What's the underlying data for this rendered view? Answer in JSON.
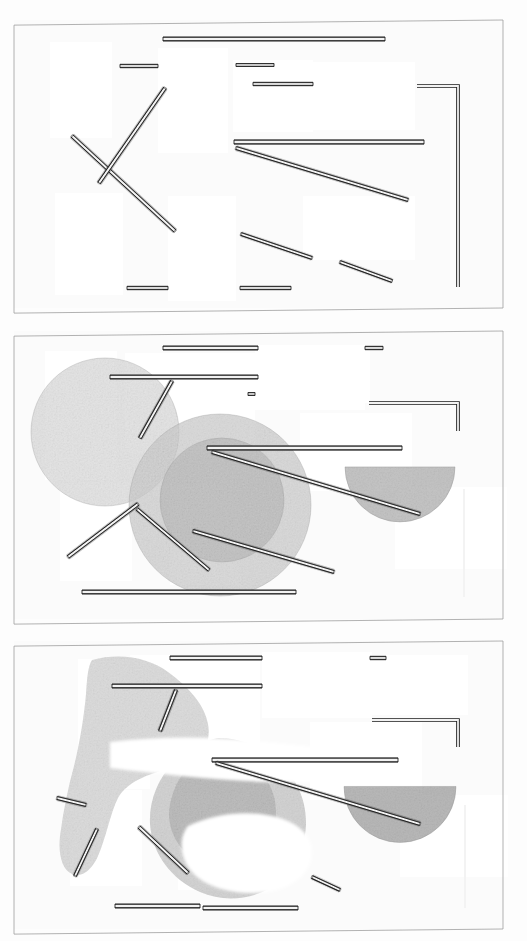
{
  "document": {
    "title": "Scanned figure sheet — three-panel rod arrangement",
    "kind": "photocopied line-drawing diagram",
    "sheet_background": "#fdfdfd",
    "paper_tint": "#fbfbfb",
    "border_color": "#9a9a9a",
    "rod_outline_color": "#1c1c1c",
    "rod_fill_color": "#f2f2f2",
    "blob_tone_light": "#d9d9d9",
    "blob_tone_mid": "#c2c2c2",
    "blob_tone_dark": "#a8a8a8",
    "patch_color": "#ffffff",
    "width": 527,
    "height": 941
  },
  "panels": [
    {
      "id": "panel-1",
      "label": "Panel 1 — rods only",
      "frame": {
        "x": 14,
        "y": 20,
        "w": 489,
        "h": 288,
        "skew_deg": -0.6
      },
      "patches": [
        {
          "x": 50,
          "y": 42,
          "w": 62,
          "h": 96
        },
        {
          "x": 158,
          "y": 48,
          "w": 70,
          "h": 105
        },
        {
          "x": 233,
          "y": 60,
          "w": 80,
          "h": 72
        },
        {
          "x": 305,
          "y": 62,
          "w": 110,
          "h": 68
        },
        {
          "x": 55,
          "y": 193,
          "w": 68,
          "h": 102
        },
        {
          "x": 168,
          "y": 196,
          "w": 68,
          "h": 105
        },
        {
          "x": 303,
          "y": 196,
          "w": 112,
          "h": 64
        }
      ],
      "rods": [
        {
          "name": "rod-top-long",
          "x1": 163,
          "y1": 39,
          "x2": 385,
          "y2": 39,
          "w": 4.0
        },
        {
          "name": "rod-upper-left",
          "x1": 120,
          "y1": 66,
          "x2": 158,
          "y2": 66,
          "w": 3.4
        },
        {
          "name": "rod-upper-mid",
          "x1": 236,
          "y1": 65,
          "x2": 274,
          "y2": 65,
          "w": 3.2
        },
        {
          "name": "rod-upper-right",
          "x1": 253,
          "y1": 84,
          "x2": 313,
          "y2": 84,
          "w": 3.4
        },
        {
          "name": "rod-mid-long",
          "x1": 234,
          "y1": 142,
          "x2": 424,
          "y2": 142,
          "w": 4.2
        },
        {
          "name": "rod-diag-descending",
          "x1": 236,
          "y1": 148,
          "x2": 408,
          "y2": 200,
          "w": 3.6
        },
        {
          "name": "rod-diag-x-a",
          "x1": 72,
          "y1": 136,
          "x2": 175,
          "y2": 231,
          "w": 3.6
        },
        {
          "name": "rod-diag-x-b",
          "x1": 165,
          "y1": 88,
          "x2": 99,
          "y2": 183,
          "w": 3.6
        },
        {
          "name": "rod-lower-diag",
          "x1": 241,
          "y1": 234,
          "x2": 312,
          "y2": 258,
          "w": 3.4
        },
        {
          "name": "rod-lower-right-diag",
          "x1": 340,
          "y1": 262,
          "x2": 392,
          "y2": 281,
          "w": 3.4
        },
        {
          "name": "rod-bottom-left",
          "x1": 127,
          "y1": 288,
          "x2": 168,
          "y2": 288,
          "w": 3.4
        },
        {
          "name": "rod-bottom-mid",
          "x1": 240,
          "y1": 288,
          "x2": 291,
          "y2": 288,
          "w": 3.4
        }
      ],
      "bent_rods": [
        {
          "name": "bent-rod-right-L",
          "pts": "417,86 458,86 458,287",
          "w": 3.6
        }
      ],
      "blobs": []
    },
    {
      "id": "panel-2",
      "label": "Panel 2 — rods with translucent discs",
      "frame": {
        "x": 14,
        "y": 331,
        "w": 489,
        "h": 288,
        "skew_deg": -0.6
      },
      "patches": [
        {
          "x": 45,
          "y": 351,
          "w": 72,
          "h": 129
        },
        {
          "x": 125,
          "y": 353,
          "w": 130,
          "h": 100
        },
        {
          "x": 255,
          "y": 345,
          "w": 110,
          "h": 65
        },
        {
          "x": 258,
          "y": 348,
          "w": 112,
          "h": 55
        },
        {
          "x": 60,
          "y": 483,
          "w": 72,
          "h": 98
        },
        {
          "x": 170,
          "y": 485,
          "w": 70,
          "h": 100
        },
        {
          "x": 300,
          "y": 413,
          "w": 112,
          "h": 78
        },
        {
          "x": 395,
          "y": 487,
          "w": 112,
          "h": 82
        }
      ],
      "rods": [
        {
          "name": "rod-top-long",
          "x1": 163,
          "y1": 348,
          "x2": 258,
          "y2": 348,
          "w": 4.0
        },
        {
          "name": "rod-top-short-right",
          "x1": 365,
          "y1": 348,
          "x2": 383,
          "y2": 348,
          "w": 3.4
        },
        {
          "name": "rod-band-long",
          "x1": 110,
          "y1": 377,
          "x2": 258,
          "y2": 377,
          "w": 4.0
        },
        {
          "name": "rod-tick-mid",
          "x1": 248,
          "y1": 394,
          "x2": 255,
          "y2": 394,
          "w": 3.2
        },
        {
          "name": "rod-mid-long",
          "x1": 207,
          "y1": 448,
          "x2": 402,
          "y2": 448,
          "w": 4.2
        },
        {
          "name": "rod-diag-descending",
          "x1": 212,
          "y1": 452,
          "x2": 420,
          "y2": 514,
          "w": 3.6
        },
        {
          "name": "rod-diag-upper-left",
          "x1": 172,
          "y1": 381,
          "x2": 140,
          "y2": 438,
          "w": 3.6
        },
        {
          "name": "rod-diag-lower-left",
          "x1": 138,
          "y1": 504,
          "x2": 68,
          "y2": 557,
          "w": 3.6
        },
        {
          "name": "rod-diag-mid",
          "x1": 193,
          "y1": 531,
          "x2": 334,
          "y2": 572,
          "w": 3.6
        },
        {
          "name": "rod-diag-mid-b",
          "x1": 137,
          "y1": 509,
          "x2": 209,
          "y2": 570,
          "w": 3.4
        },
        {
          "name": "rod-bottom-long",
          "x1": 82,
          "y1": 592,
          "x2": 296,
          "y2": 592,
          "w": 4.0
        }
      ],
      "bent_rods": [
        {
          "name": "bent-rod-right-L",
          "pts": "369,403 458,403 458,431",
          "w": 3.6
        },
        {
          "name": "rod-right-vertical",
          "pts": "464,489 464,597",
          "w": 3.6
        }
      ],
      "blobs": [
        {
          "name": "disc-large-left",
          "type": "circle",
          "cx": 105,
          "cy": 432,
          "r": 74,
          "tone": "#dcdcdc",
          "alpha": 0.75
        },
        {
          "name": "disc-large-mid",
          "type": "circle",
          "cx": 220,
          "cy": 505,
          "r": 91,
          "tone": "#cdcdcd",
          "alpha": 0.72
        },
        {
          "name": "disc-core-mid",
          "type": "circle",
          "cx": 222,
          "cy": 500,
          "r": 62,
          "tone": "#b9b9b9",
          "alpha": 0.62
        },
        {
          "name": "half-disc-right",
          "type": "halfdisc",
          "cx": 400,
          "cy": 490,
          "r": 55,
          "tone": "#b5b5b5",
          "alpha": 0.78
        }
      ]
    },
    {
      "id": "panel-3",
      "label": "Panel 3 — rods with eroded / clipped discs",
      "frame": {
        "x": 14,
        "y": 641,
        "w": 489,
        "h": 288,
        "skew_deg": -0.6
      },
      "patches": [
        {
          "x": 78,
          "y": 659,
          "w": 72,
          "h": 130
        },
        {
          "x": 130,
          "y": 655,
          "w": 130,
          "h": 100
        },
        {
          "x": 262,
          "y": 652,
          "w": 110,
          "h": 66
        },
        {
          "x": 368,
          "y": 655,
          "w": 100,
          "h": 60
        },
        {
          "x": 70,
          "y": 790,
          "w": 72,
          "h": 96
        },
        {
          "x": 178,
          "y": 792,
          "w": 70,
          "h": 98
        },
        {
          "x": 310,
          "y": 722,
          "w": 112,
          "h": 78
        },
        {
          "x": 400,
          "y": 795,
          "w": 108,
          "h": 82
        }
      ],
      "rods": [
        {
          "name": "rod-top-long",
          "x1": 170,
          "y1": 658,
          "x2": 262,
          "y2": 658,
          "w": 4.0
        },
        {
          "name": "rod-top-short-right",
          "x1": 370,
          "y1": 658,
          "x2": 386,
          "y2": 658,
          "w": 3.4
        },
        {
          "name": "rod-band-long",
          "x1": 112,
          "y1": 686,
          "x2": 262,
          "y2": 686,
          "w": 4.0
        },
        {
          "name": "rod-mid-long",
          "x1": 212,
          "y1": 760,
          "x2": 398,
          "y2": 760,
          "w": 4.2
        },
        {
          "name": "rod-diag-descending",
          "x1": 216,
          "y1": 763,
          "x2": 420,
          "y2": 824,
          "w": 3.6
        },
        {
          "name": "rod-diag-upper-left",
          "x1": 176,
          "y1": 690,
          "x2": 160,
          "y2": 731,
          "w": 3.6
        },
        {
          "name": "rod-stub-left",
          "x1": 57,
          "y1": 798,
          "x2": 86,
          "y2": 805,
          "w": 3.6
        },
        {
          "name": "rod-diag-lower-left",
          "x1": 97,
          "y1": 829,
          "x2": 75,
          "y2": 876,
          "w": 3.4
        },
        {
          "name": "rod-diag-mid",
          "x1": 139,
          "y1": 827,
          "x2": 188,
          "y2": 873,
          "w": 3.6
        },
        {
          "name": "rod-short-diag-low",
          "x1": 312,
          "y1": 877,
          "x2": 340,
          "y2": 890,
          "w": 3.4
        },
        {
          "name": "rod-bottom-left",
          "x1": 115,
          "y1": 906,
          "x2": 200,
          "y2": 906,
          "w": 4.0
        },
        {
          "name": "rod-bottom-mid",
          "x1": 203,
          "y1": 908,
          "x2": 298,
          "y2": 908,
          "w": 4.0
        }
      ],
      "bent_rods": [
        {
          "name": "bent-rod-right-L",
          "pts": "372,720 458,720 458,747",
          "w": 3.6
        },
        {
          "name": "rod-right-vertical",
          "pts": "465,805 465,908",
          "w": 3.6
        }
      ],
      "blobs": [
        {
          "name": "eroded-blob-left",
          "type": "path",
          "tone": "#cfcfcf",
          "alpha": 0.72,
          "d": "M92,660 C120,652 150,658 168,672 C190,688 205,706 208,724 C212,746 200,760 178,766 C152,773 128,780 118,798 C110,814 106,838 98,856 C92,870 82,878 72,874 C62,870 58,854 60,836 C63,812 68,788 74,766 C80,742 84,716 86,694 C87,678 88,666 92,660 Z"
        },
        {
          "name": "eroded-disc-mid",
          "type": "path",
          "tone": "#c4c4c4",
          "alpha": 0.72,
          "d": "M218,738 C266,738 306,776 306,822 C306,850 292,874 270,888 C250,900 222,902 200,892 C172,880 152,854 150,824 C148,790 170,756 200,744 C206,741 212,739 218,738 Z"
        },
        {
          "name": "eroded-disc-core",
          "type": "path",
          "tone": "#b0b0b0",
          "alpha": 0.6,
          "d": "M215,752 C248,752 276,778 276,812 C276,832 266,850 250,860 C232,871 208,870 192,858 C174,845 166,824 170,804 C176,775 194,756 215,752 Z"
        },
        {
          "name": "white-bite-upper",
          "type": "path",
          "tone": "#ffffff",
          "alpha": 1,
          "d": "M110,742 C160,736 214,736 268,742 C320,748 360,752 400,748 L400,776 C356,782 312,784 266,782 C214,780 158,774 110,768 Z"
        },
        {
          "name": "white-bite-lower",
          "type": "path",
          "tone": "#ffffff",
          "alpha": 1,
          "d": "M188,826 C214,814 244,810 272,816 C296,821 312,834 312,852 C312,872 294,888 268,892 C236,896 206,888 192,872 C180,858 178,838 188,826 Z"
        },
        {
          "name": "half-disc-right",
          "type": "halfdisc",
          "cx": 400,
          "cy": 810,
          "r": 56,
          "tone": "#a8a8a8",
          "alpha": 0.8
        }
      ]
    }
  ],
  "legend": {
    "note_visible": false
  }
}
